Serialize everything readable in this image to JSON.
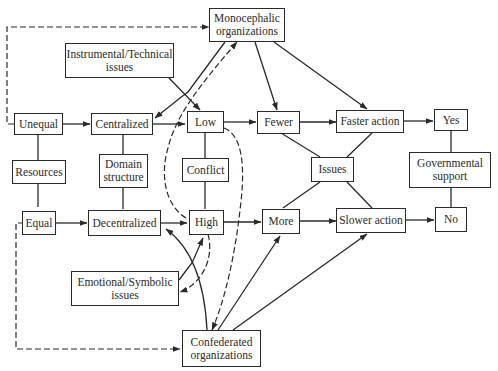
{
  "diagram": {
    "nodes": {
      "monocephalic": "Monocephalic\norganizations",
      "instrumental": "Instrumental/Technical\nissues",
      "unequal": "Unequal",
      "centralized": "Centralized",
      "low": "Low",
      "fewer": "Fewer",
      "faster": "Faster action",
      "yes": "Yes",
      "resources": "Resources",
      "domain": "Domain\nstructure",
      "conflict": "Conflict",
      "issues": "Issues",
      "governmental": "Governmental\nsupport",
      "equal": "Equal",
      "decentralized": "Decentralized",
      "high": "High",
      "more": "More",
      "slower": "Slower action",
      "no": "No",
      "emotional": "Emotional/Symbolic\nissues",
      "confederated": "Confederated\norganizations"
    },
    "edges": [
      {
        "from": "unequal",
        "to": "centralized",
        "style": "solid-arrow"
      },
      {
        "from": "centralized",
        "to": "low",
        "style": "solid-arrow"
      },
      {
        "from": "low",
        "to": "fewer",
        "style": "solid-arrow"
      },
      {
        "from": "fewer",
        "to": "faster",
        "style": "solid-arrow"
      },
      {
        "from": "faster",
        "to": "yes",
        "style": "solid-arrow"
      },
      {
        "from": "equal",
        "to": "decentralized",
        "style": "solid-arrow"
      },
      {
        "from": "decentralized",
        "to": "high",
        "style": "solid-arrow"
      },
      {
        "from": "high",
        "to": "more",
        "style": "solid-arrow"
      },
      {
        "from": "more",
        "to": "slower",
        "style": "solid-arrow"
      },
      {
        "from": "slower",
        "to": "no",
        "style": "solid-arrow"
      },
      {
        "from": "monocephalic",
        "to": "fewer",
        "style": "solid-arrow"
      },
      {
        "from": "monocephalic",
        "to": "faster",
        "style": "solid-arrow"
      },
      {
        "from": "monocephalic",
        "to": "centralized",
        "style": "solid-arrow"
      },
      {
        "from": "instrumental",
        "to": "low",
        "style": "solid-arrow"
      },
      {
        "from": "low",
        "to": "monocephalic",
        "style": "dashed-arrow"
      },
      {
        "from": "unequal",
        "to": "monocephalic",
        "style": "dashed-arrow"
      },
      {
        "from": "confederated",
        "to": "decentralized",
        "style": "solid-arrow"
      },
      {
        "from": "confederated",
        "to": "more",
        "style": "solid-arrow"
      },
      {
        "from": "confederated",
        "to": "slower",
        "style": "solid-arrow"
      },
      {
        "from": "emotional",
        "to": "high",
        "style": "solid-arrow"
      },
      {
        "from": "high",
        "to": "emotional",
        "style": "dashed-arrow"
      },
      {
        "from": "high",
        "to": "confederated",
        "style": "dashed-arrow"
      },
      {
        "from": "equal",
        "to": "confederated",
        "style": "dashed-arrow"
      },
      {
        "from": "resources",
        "to": "unequal",
        "style": "line"
      },
      {
        "from": "resources",
        "to": "equal",
        "style": "line"
      },
      {
        "from": "domain",
        "to": "centralized",
        "style": "line"
      },
      {
        "from": "domain",
        "to": "decentralized",
        "style": "line"
      },
      {
        "from": "conflict",
        "to": "low",
        "style": "line"
      },
      {
        "from": "conflict",
        "to": "high",
        "style": "line"
      },
      {
        "from": "issues",
        "to": "fewer",
        "style": "line"
      },
      {
        "from": "issues",
        "to": "faster",
        "style": "line"
      },
      {
        "from": "issues",
        "to": "more",
        "style": "line"
      },
      {
        "from": "issues",
        "to": "slower",
        "style": "line"
      },
      {
        "from": "governmental",
        "to": "yes",
        "style": "line"
      },
      {
        "from": "governmental",
        "to": "no",
        "style": "line"
      }
    ]
  }
}
